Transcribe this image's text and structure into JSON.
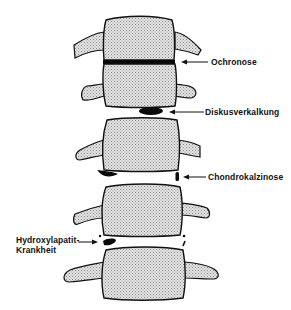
{
  "diagram": {
    "type": "anatomical-illustration",
    "colors": {
      "bone_fill": "#d9d9d9",
      "outline": "#111111",
      "calcification": "#0a0a0a",
      "background": "#ffffff"
    },
    "labels": [
      {
        "id": "ochronose",
        "text": "Ochronose"
      },
      {
        "id": "diskusverkalkung",
        "text": "Diskusverkalkung"
      },
      {
        "id": "chondrokalzinose",
        "text": "Chondrokalzinose"
      },
      {
        "id": "hydroxylapatit_line1",
        "text": "Hydroxylapatit-"
      },
      {
        "id": "hydroxylapatit_line2",
        "text": "Krankheit"
      }
    ],
    "vertebrae_count": 5
  }
}
